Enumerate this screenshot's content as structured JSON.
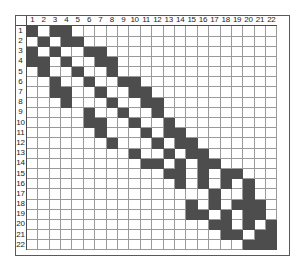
{
  "colors": {
    "filled": "#4d4d4d",
    "empty": "#ffffff",
    "gridline": "#9a9a9a",
    "frame": "#5a5a5a",
    "header_text": "#1a1a1a",
    "background": "#ffffff"
  },
  "grid": {
    "rows": 22,
    "cols": 22,
    "corner_label": "",
    "column_headers": [
      "1",
      "2",
      "3",
      "4",
      "5",
      "6",
      "7",
      "8",
      "9",
      "10",
      "11",
      "12",
      "13",
      "14",
      "15",
      "16",
      "17",
      "18",
      "19",
      "20",
      "21",
      "22"
    ],
    "row_headers": [
      "1",
      "2",
      "3",
      "4",
      "5",
      "6",
      "7",
      "8",
      "9",
      "10",
      "11",
      "12",
      "13",
      "14",
      "15",
      "16",
      "17",
      "18",
      "19",
      "20",
      "21",
      "22"
    ]
  },
  "chart_data": {
    "type": "heatmap",
    "xlabel": "",
    "ylabel": "",
    "legend": [],
    "categories_x": [
      "1",
      "2",
      "3",
      "4",
      "5",
      "6",
      "7",
      "8",
      "9",
      "10",
      "11",
      "12",
      "13",
      "14",
      "15",
      "16",
      "17",
      "18",
      "19",
      "20",
      "21",
      "22"
    ],
    "categories_y": [
      "1",
      "2",
      "3",
      "4",
      "5",
      "6",
      "7",
      "8",
      "9",
      "10",
      "11",
      "12",
      "13",
      "14",
      "15",
      "16",
      "17",
      "18",
      "19",
      "20",
      "21",
      "22"
    ],
    "value_meaning": {
      "1": "filled (dark)",
      "0": "empty (white)"
    },
    "matrix": [
      [
        1,
        0,
        1,
        1,
        0,
        0,
        0,
        0,
        0,
        0,
        0,
        0,
        0,
        0,
        0,
        0,
        0,
        0,
        0,
        0,
        0,
        0
      ],
      [
        0,
        1,
        0,
        1,
        1,
        0,
        0,
        0,
        0,
        0,
        0,
        0,
        0,
        0,
        0,
        0,
        0,
        0,
        0,
        0,
        0,
        0
      ],
      [
        1,
        0,
        1,
        0,
        0,
        1,
        1,
        0,
        0,
        0,
        0,
        0,
        0,
        0,
        0,
        0,
        0,
        0,
        0,
        0,
        0,
        0
      ],
      [
        1,
        1,
        0,
        1,
        0,
        0,
        1,
        1,
        0,
        0,
        0,
        0,
        0,
        0,
        0,
        0,
        0,
        0,
        0,
        0,
        0,
        0
      ],
      [
        0,
        1,
        0,
        0,
        1,
        0,
        0,
        1,
        0,
        0,
        0,
        0,
        0,
        0,
        0,
        0,
        0,
        0,
        0,
        0,
        0,
        0
      ],
      [
        0,
        0,
        1,
        0,
        0,
        1,
        0,
        0,
        1,
        1,
        0,
        0,
        0,
        0,
        0,
        0,
        0,
        0,
        0,
        0,
        0,
        0
      ],
      [
        0,
        0,
        1,
        1,
        0,
        0,
        1,
        0,
        0,
        1,
        1,
        0,
        0,
        0,
        0,
        0,
        0,
        0,
        0,
        0,
        0,
        0
      ],
      [
        0,
        0,
        0,
        1,
        0,
        0,
        0,
        1,
        0,
        0,
        1,
        1,
        0,
        0,
        0,
        0,
        0,
        0,
        0,
        0,
        0,
        0
      ],
      [
        0,
        0,
        0,
        0,
        0,
        1,
        0,
        0,
        1,
        0,
        0,
        1,
        0,
        0,
        0,
        0,
        0,
        0,
        0,
        0,
        0,
        0
      ],
      [
        0,
        0,
        0,
        0,
        0,
        1,
        1,
        0,
        0,
        1,
        0,
        0,
        1,
        0,
        0,
        0,
        0,
        0,
        0,
        0,
        0,
        0
      ],
      [
        0,
        0,
        0,
        0,
        0,
        0,
        1,
        0,
        0,
        0,
        1,
        0,
        1,
        1,
        0,
        0,
        0,
        0,
        0,
        0,
        0,
        0
      ],
      [
        0,
        0,
        0,
        0,
        0,
        0,
        0,
        1,
        0,
        0,
        0,
        1,
        0,
        1,
        1,
        0,
        0,
        0,
        0,
        0,
        0,
        0
      ],
      [
        0,
        0,
        0,
        0,
        0,
        0,
        0,
        0,
        0,
        1,
        0,
        0,
        1,
        0,
        1,
        1,
        0,
        0,
        0,
        0,
        0,
        0
      ],
      [
        0,
        0,
        0,
        0,
        0,
        0,
        0,
        0,
        0,
        0,
        1,
        1,
        0,
        1,
        0,
        1,
        1,
        0,
        0,
        0,
        0,
        0
      ],
      [
        0,
        0,
        0,
        0,
        0,
        0,
        0,
        0,
        0,
        0,
        0,
        0,
        1,
        1,
        0,
        1,
        0,
        1,
        1,
        0,
        0,
        0
      ],
      [
        0,
        0,
        0,
        0,
        0,
        0,
        0,
        0,
        0,
        0,
        0,
        0,
        0,
        1,
        0,
        1,
        0,
        1,
        0,
        1,
        0,
        0
      ],
      [
        0,
        0,
        0,
        0,
        0,
        0,
        0,
        0,
        0,
        0,
        0,
        0,
        0,
        0,
        0,
        0,
        1,
        0,
        0,
        1,
        0,
        0
      ],
      [
        0,
        0,
        0,
        0,
        0,
        0,
        0,
        0,
        0,
        0,
        0,
        0,
        0,
        0,
        1,
        0,
        1,
        0,
        1,
        1,
        1,
        0
      ],
      [
        0,
        0,
        0,
        0,
        0,
        0,
        0,
        0,
        0,
        0,
        0,
        0,
        0,
        0,
        1,
        1,
        0,
        1,
        0,
        1,
        1,
        0
      ],
      [
        0,
        0,
        0,
        0,
        0,
        0,
        0,
        0,
        0,
        0,
        0,
        0,
        0,
        0,
        0,
        0,
        1,
        1,
        0,
        1,
        0,
        1
      ],
      [
        0,
        0,
        0,
        0,
        0,
        0,
        0,
        0,
        0,
        0,
        0,
        0,
        0,
        0,
        0,
        0,
        0,
        1,
        1,
        0,
        1,
        1
      ],
      [
        0,
        0,
        0,
        0,
        0,
        0,
        0,
        0,
        0,
        0,
        0,
        0,
        0,
        0,
        0,
        0,
        0,
        0,
        0,
        1,
        1,
        1
      ]
    ]
  }
}
